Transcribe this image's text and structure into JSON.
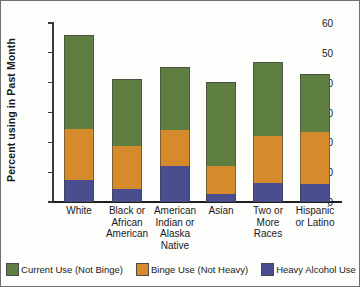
{
  "chart_data": {
    "type": "bar",
    "subtype": "stacked-bar",
    "title": "",
    "xlabel": "",
    "ylabel": "Percent using in Past Month",
    "ylim": [
      0,
      60
    ],
    "yticks": [
      0,
      10,
      20,
      30,
      40,
      50,
      60
    ],
    "ytick_labels": [
      "0",
      "10",
      "20",
      "30",
      "40",
      "50",
      "60"
    ],
    "grid": false,
    "legend_position": "bottom",
    "categories": [
      "White",
      "Black or African American",
      "American Indian or Alaska Native",
      "Asian",
      "Two or More Races",
      "Hispanic or Latino"
    ],
    "category_lines": [
      [
        "White"
      ],
      [
        "Black or",
        "African",
        "American"
      ],
      [
        "American",
        "Indian or",
        "Alaska",
        "Native"
      ],
      [
        "Asian"
      ],
      [
        "Two or",
        "More",
        "Races"
      ],
      [
        "Hispanic",
        "or Latino"
      ]
    ],
    "series": [
      {
        "name": "Heavy Alcohol Use",
        "color": "#4a4e91",
        "values": [
          7.5,
          4.5,
          12.2,
          2.6,
          6.3,
          6.0
        ]
      },
      {
        "name": "Binge Use (Not Heavy)",
        "color": "#d58a2c",
        "values": [
          17.0,
          14.2,
          11.8,
          9.4,
          15.7,
          17.5
        ]
      },
      {
        "name": "Current Use (Not Binge)",
        "color": "#5e7f41",
        "values": [
          31.5,
          22.6,
          21.3,
          28.2,
          25.0,
          19.5
        ]
      }
    ],
    "stack_boundaries": {
      "heavy_top": [
        7.5,
        4.5,
        12.2,
        2.6,
        6.3,
        6.0
      ],
      "binge_top": [
        24.5,
        18.7,
        24.0,
        12.0,
        22.0,
        23.5
      ],
      "total": [
        56.0,
        41.3,
        45.3,
        40.2,
        47.0,
        43.0
      ]
    },
    "totals": [
      56.0,
      41.3,
      45.3,
      40.2,
      47.0,
      43.0
    ],
    "legend_entries": [
      {
        "label": "Current Use (Not Binge)",
        "color": "#5e7f41"
      },
      {
        "label": "Binge Use (Not Heavy)",
        "color": "#d58a2c"
      },
      {
        "label": "Heavy Alcohol Use",
        "color": "#4a4e91"
      }
    ]
  }
}
